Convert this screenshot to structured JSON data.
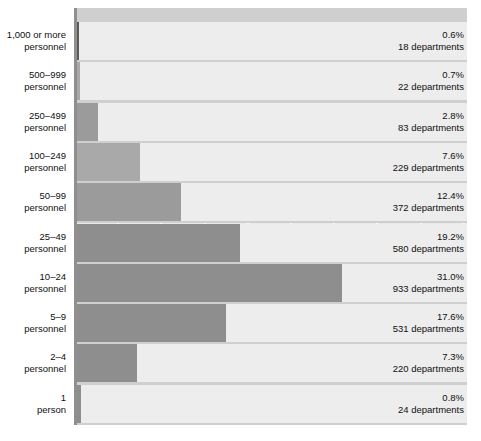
{
  "chart_data": {
    "type": "bar",
    "orientation": "horizontal",
    "title": "",
    "subtitle": "",
    "xlabel": "",
    "ylabel": "",
    "xlim": [
      0,
      45
    ],
    "grid": true,
    "gridline_interval_pct": 5,
    "legend": "none",
    "categories": [
      "1,000 or more personnel",
      "500–999 personnel",
      "250–499 personnel",
      "100–249 personnel",
      "50–99 personnel",
      "25–49 personnel",
      "10–24 personnel",
      "5–9 personnel",
      "2–4 personnel",
      "1 person"
    ],
    "values": [
      0.6,
      0.7,
      2.8,
      7.6,
      12.4,
      19.2,
      31.0,
      17.6,
      7.3,
      0.8
    ],
    "counts": [
      18,
      22,
      83,
      229,
      372,
      580,
      933,
      531,
      220,
      24
    ],
    "value_unit": "%",
    "count_unit": "departments"
  },
  "rows": [
    {
      "cat_line1": "1,000 or more",
      "cat_line2": "personnel",
      "pct": "0.6%",
      "departments": "18 departments",
      "value": 0.6,
      "shade": "dark"
    },
    {
      "cat_line1": "500–999",
      "cat_line2": "personnel",
      "pct": "0.7%",
      "departments": "22 departments",
      "value": 0.7,
      "shade": "light"
    },
    {
      "cat_line1": "250–499",
      "cat_line2": "personnel",
      "pct": "2.8%",
      "departments": "83 departments",
      "value": 2.8,
      "shade": "mid"
    },
    {
      "cat_line1": "100–249",
      "cat_line2": "personnel",
      "pct": "7.6%",
      "departments": "229 departments",
      "value": 7.6,
      "shade": "light"
    },
    {
      "cat_line1": "50–99",
      "cat_line2": "personnel",
      "pct": "12.4%",
      "departments": "372 departments",
      "value": 12.4,
      "shade": "mid"
    },
    {
      "cat_line1": "25–49",
      "cat_line2": "personnel",
      "pct": "19.2%",
      "departments": "580 departments",
      "value": 19.2,
      "shade": "default"
    },
    {
      "cat_line1": "10–24",
      "cat_line2": "personnel",
      "pct": "31.0%",
      "departments": "933 departments",
      "value": 31.0,
      "shade": "default"
    },
    {
      "cat_line1": "5–9",
      "cat_line2": "personnel",
      "pct": "17.6%",
      "departments": "531 departments",
      "value": 17.6,
      "shade": "default"
    },
    {
      "cat_line1": "2–4",
      "cat_line2": "personnel",
      "pct": "7.3%",
      "departments": "220 departments",
      "value": 7.3,
      "shade": "default"
    },
    {
      "cat_line1": "1",
      "cat_line2": "person",
      "pct": "0.8%",
      "departments": "24 departments",
      "value": 0.8,
      "shade": "default"
    }
  ],
  "colors": {
    "plot_background": "#e9e9e9",
    "row_plate": "#ededed",
    "band": "#cfcfcf",
    "gridline": "#fbfbfb",
    "axis": "#8f8f8f",
    "bar_default": "#8e8e8e",
    "bar_dark": "#5c5c5c",
    "bar_mid": "#9b9b9b",
    "bar_light": "#a9a9a9",
    "text": "#101010",
    "page_background": "#ffffff"
  }
}
